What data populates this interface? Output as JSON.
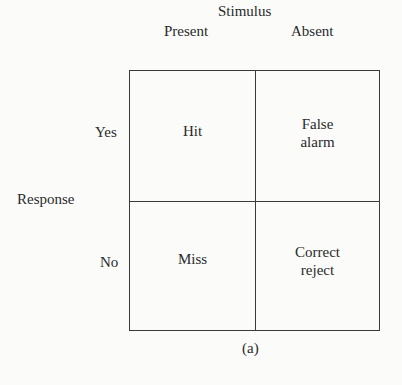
{
  "diagram": {
    "column_axis_label": "Stimulus",
    "columns": [
      "Present",
      "Absent"
    ],
    "row_axis_label": "Response",
    "rows": [
      "Yes",
      "No"
    ],
    "cells": [
      [
        "Hit",
        "False\nalarm"
      ],
      [
        "Miss",
        "Correct\nreject"
      ]
    ],
    "cells_display": {
      "yes_present": "Hit",
      "yes_absent_line1": "False",
      "yes_absent_line2": "alarm",
      "no_present": "Miss",
      "no_absent_line1": "Correct",
      "no_absent_line2": "reject"
    },
    "caption": "(a)"
  }
}
